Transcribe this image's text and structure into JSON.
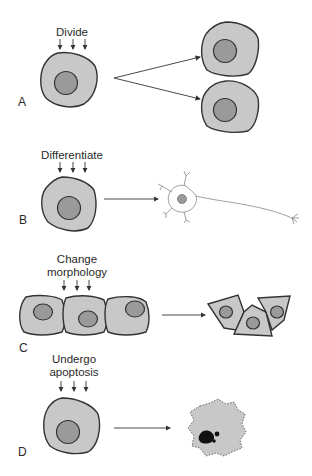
{
  "figure": {
    "panels": [
      {
        "id": "A",
        "label": "A",
        "stimulus_lines": [
          "Divide"
        ],
        "result": "two daughter cells"
      },
      {
        "id": "B",
        "label": "B",
        "stimulus_lines": [
          "Differentiate"
        ],
        "result": "neuron"
      },
      {
        "id": "C",
        "label": "C",
        "stimulus_lines": [
          "Change",
          "morphology"
        ],
        "result": "reshaped epithelial cells"
      },
      {
        "id": "D",
        "label": "D",
        "stimulus_lines": [
          "Undergo",
          "apoptosis"
        ],
        "result": "apoptotic cell with condensed nucleus"
      }
    ],
    "colors": {
      "cytoplasm": "#c8c8c8",
      "nucleus": "#9a9a9a",
      "outline": "#333333",
      "apoptotic_fragment": "#111111"
    }
  }
}
